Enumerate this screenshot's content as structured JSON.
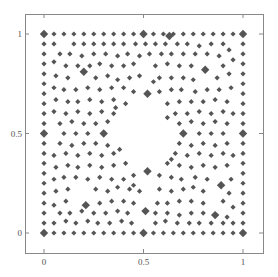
{
  "chart_data": {
    "type": "scatter",
    "title": "",
    "xlabel": "",
    "ylabel": "",
    "xlim": [
      -0.1,
      1.1
    ],
    "ylim": [
      -0.1,
      1.1
    ],
    "grid": false,
    "legend": null,
    "x_ticks": [
      {
        "value": 0,
        "label": "0"
      },
      {
        "value": 0.5,
        "label": "0.5"
      },
      {
        "value": 1,
        "label": "1"
      }
    ],
    "y_ticks": [
      {
        "value": 0,
        "label": "0"
      },
      {
        "value": 0.5,
        "label": "0.5"
      },
      {
        "value": 1,
        "label": "1"
      }
    ],
    "marker": "diamond",
    "marker_color": "#555555",
    "hole": {
      "center": [
        0.5,
        0.5
      ],
      "radius": 0.17
    },
    "boundary_spacing": 0.05,
    "large_points": [
      [
        0,
        1
      ],
      [
        0.5,
        1
      ],
      [
        1,
        1
      ],
      [
        0,
        0.5
      ],
      [
        1,
        0.5
      ],
      [
        0,
        0
      ],
      [
        0.5,
        0
      ],
      [
        1,
        0
      ],
      [
        0.2,
        0.81
      ],
      [
        0.81,
        0.82
      ],
      [
        0.3,
        0.5
      ],
      [
        0.7,
        0.5
      ],
      [
        0.52,
        0.7
      ],
      [
        0.52,
        0.31
      ],
      [
        0.21,
        0.14
      ],
      [
        0.89,
        0.24
      ],
      [
        0.51,
        0.11
      ],
      [
        0.86,
        0.09
      ],
      [
        0.63,
        0.99
      ]
    ],
    "interior_points": [
      [
        0.05,
        0.95
      ],
      [
        0.15,
        0.95
      ],
      [
        0.2,
        0.95
      ],
      [
        0.25,
        0.95
      ],
      [
        0.3,
        0.95
      ],
      [
        0.35,
        0.95
      ],
      [
        0.4,
        0.95
      ],
      [
        0.46,
        0.95
      ],
      [
        0.51,
        0.95
      ],
      [
        0.56,
        0.95
      ],
      [
        0.61,
        0.95
      ],
      [
        0.67,
        0.95
      ],
      [
        0.72,
        0.95
      ],
      [
        0.78,
        0.94
      ],
      [
        0.84,
        0.95
      ],
      [
        0.9,
        0.95
      ],
      [
        0.08,
        0.9
      ],
      [
        0.13,
        0.9
      ],
      [
        0.19,
        0.89
      ],
      [
        0.25,
        0.9
      ],
      [
        0.31,
        0.9
      ],
      [
        0.37,
        0.89
      ],
      [
        0.42,
        0.9
      ],
      [
        0.48,
        0.89
      ],
      [
        0.53,
        0.9
      ],
      [
        0.59,
        0.9
      ],
      [
        0.64,
        0.9
      ],
      [
        0.7,
        0.9
      ],
      [
        0.76,
        0.9
      ],
      [
        0.82,
        0.9
      ],
      [
        0.88,
        0.89
      ],
      [
        0.93,
        0.92
      ],
      [
        0.05,
        0.86
      ],
      [
        0.11,
        0.84
      ],
      [
        0.17,
        0.84
      ],
      [
        0.23,
        0.84
      ],
      [
        0.28,
        0.85
      ],
      [
        0.34,
        0.84
      ],
      [
        0.4,
        0.84
      ],
      [
        0.45,
        0.85
      ],
      [
        0.56,
        0.84
      ],
      [
        0.62,
        0.85
      ],
      [
        0.68,
        0.84
      ],
      [
        0.74,
        0.84
      ],
      [
        0.9,
        0.84
      ],
      [
        0.95,
        0.87
      ],
      [
        0.06,
        0.79
      ],
      [
        0.12,
        0.78
      ],
      [
        0.26,
        0.78
      ],
      [
        0.32,
        0.79
      ],
      [
        0.37,
        0.77
      ],
      [
        0.43,
        0.78
      ],
      [
        0.48,
        0.79
      ],
      [
        0.58,
        0.78
      ],
      [
        0.64,
        0.78
      ],
      [
        0.7,
        0.78
      ],
      [
        0.75,
        0.77
      ],
      [
        0.87,
        0.78
      ],
      [
        0.93,
        0.8
      ],
      [
        0.05,
        0.73
      ],
      [
        0.1,
        0.72
      ],
      [
        0.16,
        0.72
      ],
      [
        0.22,
        0.73
      ],
      [
        0.28,
        0.72
      ],
      [
        0.34,
        0.73
      ],
      [
        0.4,
        0.73
      ],
      [
        0.45,
        0.71
      ],
      [
        0.58,
        0.71
      ],
      [
        0.64,
        0.72
      ],
      [
        0.69,
        0.72
      ],
      [
        0.76,
        0.71
      ],
      [
        0.82,
        0.72
      ],
      [
        0.88,
        0.72
      ],
      [
        0.94,
        0.73
      ],
      [
        0.06,
        0.67
      ],
      [
        0.12,
        0.66
      ],
      [
        0.17,
        0.66
      ],
      [
        0.23,
        0.67
      ],
      [
        0.29,
        0.66
      ],
      [
        0.35,
        0.67
      ],
      [
        0.41,
        0.65
      ],
      [
        0.62,
        0.65
      ],
      [
        0.68,
        0.66
      ],
      [
        0.74,
        0.66
      ],
      [
        0.8,
        0.66
      ],
      [
        0.86,
        0.67
      ],
      [
        0.92,
        0.66
      ],
      [
        0.05,
        0.61
      ],
      [
        0.11,
        0.6
      ],
      [
        0.17,
        0.61
      ],
      [
        0.23,
        0.6
      ],
      [
        0.29,
        0.61
      ],
      [
        0.35,
        0.6
      ],
      [
        0.66,
        0.6
      ],
      [
        0.72,
        0.6
      ],
      [
        0.78,
        0.61
      ],
      [
        0.84,
        0.6
      ],
      [
        0.9,
        0.61
      ],
      [
        0.95,
        0.6
      ],
      [
        0.08,
        0.55
      ],
      [
        0.14,
        0.56
      ],
      [
        0.2,
        0.55
      ],
      [
        0.26,
        0.55
      ],
      [
        0.32,
        0.56
      ],
      [
        0.68,
        0.55
      ],
      [
        0.74,
        0.56
      ],
      [
        0.8,
        0.55
      ],
      [
        0.86,
        0.56
      ],
      [
        0.92,
        0.55
      ],
      [
        0.1,
        0.5
      ],
      [
        0.16,
        0.5
      ],
      [
        0.22,
        0.5
      ],
      [
        0.78,
        0.5
      ],
      [
        0.84,
        0.5
      ],
      [
        0.9,
        0.5
      ],
      [
        0.08,
        0.45
      ],
      [
        0.14,
        0.44
      ],
      [
        0.2,
        0.45
      ],
      [
        0.26,
        0.45
      ],
      [
        0.32,
        0.44
      ],
      [
        0.68,
        0.45
      ],
      [
        0.74,
        0.44
      ],
      [
        0.8,
        0.45
      ],
      [
        0.86,
        0.44
      ],
      [
        0.92,
        0.45
      ],
      [
        0.05,
        0.39
      ],
      [
        0.11,
        0.4
      ],
      [
        0.17,
        0.39
      ],
      [
        0.23,
        0.4
      ],
      [
        0.29,
        0.39
      ],
      [
        0.35,
        0.4
      ],
      [
        0.66,
        0.4
      ],
      [
        0.72,
        0.39
      ],
      [
        0.78,
        0.4
      ],
      [
        0.84,
        0.39
      ],
      [
        0.9,
        0.4
      ],
      [
        0.95,
        0.39
      ],
      [
        0.06,
        0.33
      ],
      [
        0.12,
        0.34
      ],
      [
        0.17,
        0.33
      ],
      [
        0.23,
        0.34
      ],
      [
        0.29,
        0.33
      ],
      [
        0.35,
        0.34
      ],
      [
        0.41,
        0.35
      ],
      [
        0.62,
        0.35
      ],
      [
        0.68,
        0.34
      ],
      [
        0.74,
        0.33
      ],
      [
        0.8,
        0.34
      ],
      [
        0.86,
        0.33
      ],
      [
        0.92,
        0.34
      ],
      [
        0.05,
        0.27
      ],
      [
        0.1,
        0.28
      ],
      [
        0.16,
        0.28
      ],
      [
        0.22,
        0.27
      ],
      [
        0.28,
        0.28
      ],
      [
        0.34,
        0.27
      ],
      [
        0.4,
        0.27
      ],
      [
        0.45,
        0.29
      ],
      [
        0.58,
        0.29
      ],
      [
        0.64,
        0.28
      ],
      [
        0.69,
        0.27
      ],
      [
        0.76,
        0.28
      ],
      [
        0.82,
        0.27
      ],
      [
        0.94,
        0.27
      ],
      [
        0.06,
        0.21
      ],
      [
        0.12,
        0.22
      ],
      [
        0.26,
        0.22
      ],
      [
        0.32,
        0.21
      ],
      [
        0.37,
        0.23
      ],
      [
        0.43,
        0.22
      ],
      [
        0.48,
        0.21
      ],
      [
        0.58,
        0.22
      ],
      [
        0.64,
        0.21
      ],
      [
        0.7,
        0.22
      ],
      [
        0.75,
        0.23
      ],
      [
        0.8,
        0.21
      ],
      [
        0.93,
        0.2
      ],
      [
        0.05,
        0.14
      ],
      [
        0.11,
        0.16
      ],
      [
        0.28,
        0.15
      ],
      [
        0.34,
        0.16
      ],
      [
        0.4,
        0.16
      ],
      [
        0.45,
        0.15
      ],
      [
        0.57,
        0.15
      ],
      [
        0.62,
        0.15
      ],
      [
        0.68,
        0.16
      ],
      [
        0.74,
        0.16
      ],
      [
        0.8,
        0.15
      ],
      [
        0.9,
        0.16
      ],
      [
        0.95,
        0.13
      ],
      [
        0.08,
        0.1
      ],
      [
        0.13,
        0.1
      ],
      [
        0.19,
        0.11
      ],
      [
        0.25,
        0.1
      ],
      [
        0.31,
        0.1
      ],
      [
        0.37,
        0.11
      ],
      [
        0.42,
        0.1
      ],
      [
        0.56,
        0.1
      ],
      [
        0.62,
        0.1
      ],
      [
        0.68,
        0.09
      ],
      [
        0.74,
        0.1
      ],
      [
        0.8,
        0.1
      ],
      [
        0.92,
        0.08
      ],
      [
        0.05,
        0.05
      ],
      [
        0.11,
        0.06
      ],
      [
        0.16,
        0.05
      ],
      [
        0.22,
        0.06
      ],
      [
        0.27,
        0.05
      ],
      [
        0.33,
        0.05
      ],
      [
        0.39,
        0.06
      ],
      [
        0.44,
        0.05
      ],
      [
        0.56,
        0.05
      ],
      [
        0.61,
        0.06
      ],
      [
        0.67,
        0.05
      ],
      [
        0.73,
        0.05
      ],
      [
        0.78,
        0.05
      ],
      [
        0.84,
        0.05
      ],
      [
        0.9,
        0.05
      ],
      [
        0.95,
        0.05
      ],
      [
        0.55,
        0.76
      ],
      [
        0.45,
        0.24
      ],
      [
        0.36,
        0.63
      ],
      [
        0.64,
        0.37
      ],
      [
        0.38,
        0.42
      ],
      [
        0.62,
        0.58
      ]
    ]
  }
}
